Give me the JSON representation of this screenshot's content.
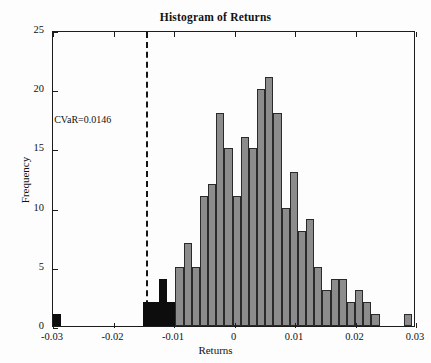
{
  "chart_data": {
    "type": "bar",
    "title": "Histogram of  Returns",
    "xlabel": "Returns",
    "ylabel": "Frequency",
    "xlim": [
      -0.03,
      0.03
    ],
    "ylim": [
      0,
      25
    ],
    "xticks": [
      -0.03,
      -0.02,
      -0.01,
      0,
      0.01,
      0.02,
      0.03
    ],
    "xtick_labels": [
      "-0.03",
      "-0.02",
      "-0.01",
      "0",
      "0.01",
      "0.02",
      "0.03"
    ],
    "yticks": [
      0,
      5,
      10,
      15,
      20,
      25
    ],
    "ytick_labels": [
      "0",
      "5",
      "10",
      "15",
      "20",
      "25"
    ],
    "grid": false,
    "legend": null,
    "bin_width": 0.00146,
    "bar_color": "#8c8c8c",
    "tail_color": "#0d0d0d",
    "edge_color": "#2a2a2a",
    "annotations": [
      {
        "name": "cvar-label",
        "text": "CVaR=0.0146",
        "x": -0.0298,
        "y": 17.6
      }
    ],
    "vlines": [
      {
        "name": "cvar-threshold",
        "x": -0.0146,
        "style": "dashed",
        "color": "#151515"
      }
    ],
    "bins": [
      {
        "x0": -0.03,
        "x1": -0.0287,
        "value": 1,
        "tail": true
      },
      {
        "x0": -0.0287,
        "x1": -0.0273,
        "value": 0,
        "tail": true
      },
      {
        "x0": -0.0273,
        "x1": -0.026,
        "value": 0,
        "tail": true
      },
      {
        "x0": -0.026,
        "x1": -0.0246,
        "value": 0,
        "tail": true
      },
      {
        "x0": -0.0246,
        "x1": -0.0233,
        "value": 0,
        "tail": true
      },
      {
        "x0": -0.0233,
        "x1": -0.0219,
        "value": 0,
        "tail": true
      },
      {
        "x0": -0.0219,
        "x1": -0.0206,
        "value": 0,
        "tail": true
      },
      {
        "x0": -0.0206,
        "x1": -0.0192,
        "value": 0,
        "tail": true
      },
      {
        "x0": -0.0192,
        "x1": -0.0179,
        "value": 0,
        "tail": true
      },
      {
        "x0": -0.0179,
        "x1": -0.0165,
        "value": 0,
        "tail": true
      },
      {
        "x0": -0.0165,
        "x1": -0.0152,
        "value": 0,
        "tail": true
      },
      {
        "x0": -0.0152,
        "x1": -0.0138,
        "value": 2,
        "tail": true
      },
      {
        "x0": -0.0138,
        "x1": -0.0125,
        "value": 2,
        "tail": true
      },
      {
        "x0": -0.0125,
        "x1": -0.0111,
        "value": 4,
        "tail": true
      },
      {
        "x0": -0.0111,
        "x1": -0.0098,
        "value": 2,
        "tail": true
      },
      {
        "x0": -0.0098,
        "x1": -0.0084,
        "value": 5,
        "tail": false
      },
      {
        "x0": -0.0084,
        "x1": -0.0071,
        "value": 7,
        "tail": false
      },
      {
        "x0": -0.0071,
        "x1": -0.0057,
        "value": 5,
        "tail": false
      },
      {
        "x0": -0.0057,
        "x1": -0.0044,
        "value": 11,
        "tail": false
      },
      {
        "x0": -0.0044,
        "x1": -0.003,
        "value": 12,
        "tail": false
      },
      {
        "x0": -0.003,
        "x1": -0.0017,
        "value": 18,
        "tail": false
      },
      {
        "x0": -0.0017,
        "x1": -0.0003,
        "value": 15,
        "tail": false
      },
      {
        "x0": -0.0003,
        "x1": 0.001,
        "value": 11,
        "tail": false
      },
      {
        "x0": 0.001,
        "x1": 0.0024,
        "value": 16,
        "tail": false
      },
      {
        "x0": 0.0024,
        "x1": 0.0037,
        "value": 15,
        "tail": false
      },
      {
        "x0": 0.0037,
        "x1": 0.0051,
        "value": 20,
        "tail": false
      },
      {
        "x0": 0.0051,
        "x1": 0.0064,
        "value": 21,
        "tail": false
      },
      {
        "x0": 0.0064,
        "x1": 0.0078,
        "value": 18,
        "tail": false
      },
      {
        "x0": 0.0078,
        "x1": 0.0091,
        "value": 10,
        "tail": false
      },
      {
        "x0": 0.0091,
        "x1": 0.0105,
        "value": 13,
        "tail": false
      },
      {
        "x0": 0.0105,
        "x1": 0.0118,
        "value": 8,
        "tail": false
      },
      {
        "x0": 0.0118,
        "x1": 0.0132,
        "value": 9,
        "tail": false
      },
      {
        "x0": 0.0132,
        "x1": 0.0145,
        "value": 5,
        "tail": false
      },
      {
        "x0": 0.0145,
        "x1": 0.0159,
        "value": 3,
        "tail": false
      },
      {
        "x0": 0.0159,
        "x1": 0.0172,
        "value": 4,
        "tail": false
      },
      {
        "x0": 0.0172,
        "x1": 0.0186,
        "value": 4,
        "tail": false
      },
      {
        "x0": 0.0186,
        "x1": 0.0199,
        "value": 2,
        "tail": false
      },
      {
        "x0": 0.0199,
        "x1": 0.0213,
        "value": 3,
        "tail": false
      },
      {
        "x0": 0.0213,
        "x1": 0.0226,
        "value": 2,
        "tail": false
      },
      {
        "x0": 0.0226,
        "x1": 0.024,
        "value": 1,
        "tail": false
      },
      {
        "x0": 0.024,
        "x1": 0.0253,
        "value": 0,
        "tail": false
      },
      {
        "x0": 0.0253,
        "x1": 0.0267,
        "value": 0,
        "tail": false
      },
      {
        "x0": 0.0267,
        "x1": 0.028,
        "value": 0,
        "tail": false
      },
      {
        "x0": 0.028,
        "x1": 0.0294,
        "value": 1,
        "tail": false
      }
    ]
  }
}
